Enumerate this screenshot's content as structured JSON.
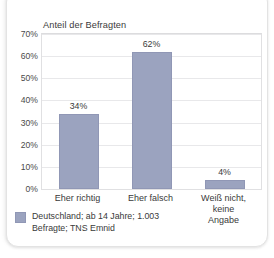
{
  "chart_data": {
    "type": "bar",
    "title": "Anteil der Befragten",
    "xlabel": "",
    "ylabel": "Anteil der Befragten",
    "categories": [
      "Eher richtig",
      "Eher falsch",
      "Weiß nicht,\nkeine Angabe"
    ],
    "values": [
      34,
      62,
      4
    ],
    "value_labels": [
      "34%",
      "62%",
      "4%"
    ],
    "ylim": [
      0,
      70
    ],
    "ytick_labels": [
      "70%",
      "60%",
      "50%",
      "40%",
      "30%",
      "20%",
      "10%",
      "0%"
    ],
    "ytick_values": [
      70,
      60,
      50,
      40,
      30,
      20,
      10,
      0
    ],
    "grid": "horizontal",
    "legend_position": "below-left",
    "series_color": "#9ba3bf",
    "bar_border_color": "#9097b5",
    "grid_color": "#e8e8ea",
    "text_color": "#3a3a3a"
  },
  "legend": {
    "swatch_name": "series-swatch",
    "note": "Deutschland; ab 14 Jahre; 1.003\nBefragte; TNS Emnid"
  }
}
